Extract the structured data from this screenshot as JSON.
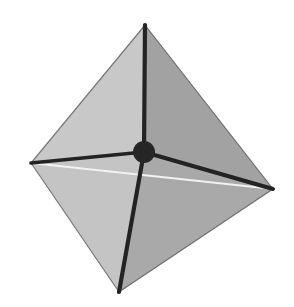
{
  "figure": {
    "background_color": "#ffffff",
    "canvas": {
      "width": 294,
      "height": 307
    }
  },
  "shape": {
    "name": "octahedron",
    "vertex_count": 6,
    "face_count": 8,
    "visible_face_count": 4,
    "edge_count": 12,
    "vertices": [
      {
        "id": "top",
        "label": "top-apex-vertex",
        "x": 145,
        "y": 25
      },
      {
        "id": "bottom",
        "label": "bottom-apex-vertex",
        "x": 119,
        "y": 292
      },
      {
        "id": "left",
        "label": "left-equator-vertex",
        "x": 31,
        "y": 163
      },
      {
        "id": "right",
        "label": "right-equator-vertex",
        "x": 273,
        "y": 189
      },
      {
        "id": "front",
        "label": "front-center-vertex",
        "x": 144,
        "y": 152
      },
      {
        "id": "back",
        "label": "back-hidden-vertex",
        "x": 156,
        "y": 181
      }
    ],
    "faces": [
      {
        "id": "upper-left",
        "label": "upper-left-face",
        "vertices": [
          "top",
          "left",
          "front"
        ],
        "color": "#c8c8c8"
      },
      {
        "id": "upper-right",
        "label": "upper-right-face",
        "vertices": [
          "top",
          "front",
          "right"
        ],
        "color": "#a2a2a2"
      },
      {
        "id": "lower-left",
        "label": "lower-left-face",
        "vertices": [
          "left",
          "front",
          "bottom"
        ],
        "color": "#c4c4c4"
      },
      {
        "id": "lower-right",
        "label": "lower-right-face",
        "vertices": [
          "front",
          "right",
          "bottom"
        ],
        "color": "#a9a9a9"
      }
    ],
    "front_edges": [
      {
        "id": "top-to-front",
        "label": "edge-top-to-center",
        "from": "top",
        "to": "front",
        "width": 4.2
      },
      {
        "id": "left-to-front",
        "label": "edge-left-to-center",
        "from": "left",
        "to": "front",
        "width": 3.6
      },
      {
        "id": "right-to-front",
        "label": "edge-right-to-center",
        "from": "right",
        "to": "front",
        "width": 4.0
      },
      {
        "id": "bottom-to-front",
        "label": "edge-bottom-to-center",
        "from": "front",
        "to": "bottom",
        "width": 4.2
      }
    ],
    "silhouette_edges": [
      {
        "id": "top-left",
        "label": "silhouette-top-left",
        "from": "top",
        "to": "left"
      },
      {
        "id": "top-right",
        "label": "silhouette-top-right",
        "from": "top",
        "to": "right"
      },
      {
        "id": "left-bottom",
        "label": "silhouette-left-bottom",
        "from": "left",
        "to": "bottom"
      },
      {
        "id": "right-bottom",
        "label": "silhouette-right-bottom",
        "from": "right",
        "to": "bottom"
      }
    ],
    "back_edges": [
      {
        "id": "left-to-right-back",
        "label": "hidden-equator-edge",
        "from": "left",
        "to": "right",
        "color": "#f2f2ee",
        "width": 1.8
      }
    ],
    "center_marker": {
      "label": "center-vertex-dot",
      "x": 144,
      "y": 152,
      "radius": 11,
      "color": "#262626"
    }
  },
  "colors": {
    "edge_dark": "#232323",
    "face_light": "#c8c8c8",
    "face_medium": "#a2a2a2",
    "back_edge_light": "#f2f2ee",
    "background": "#ffffff"
  }
}
